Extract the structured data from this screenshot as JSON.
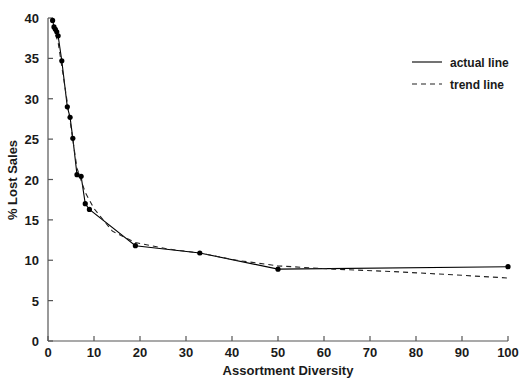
{
  "chart_data": {
    "type": "line",
    "title": "",
    "xlabel": "Assortment Diversity",
    "ylabel": "% Lost Sales",
    "xlim": [
      0,
      100
    ],
    "ylim": [
      0,
      40
    ],
    "xticks": [
      0,
      10,
      20,
      30,
      40,
      50,
      60,
      70,
      80,
      90,
      100
    ],
    "yticks": [
      0,
      5,
      10,
      15,
      20,
      25,
      30,
      35,
      40
    ],
    "xtick_labels": [
      "0",
      "10",
      "20",
      "30",
      "40",
      "50",
      "60",
      "70",
      "80",
      "90",
      "100"
    ],
    "ytick_labels": [
      "0",
      "5",
      "10",
      "15",
      "20",
      "25",
      "30",
      "35",
      "40"
    ],
    "grid": false,
    "legend_position": "top-right",
    "series": [
      {
        "name": "actual line",
        "style": "solid",
        "color": "#000000",
        "markers": true,
        "x": [
          1.0,
          1.3,
          1.6,
          1.9,
          2.2,
          3.0,
          4.2,
          4.8,
          5.4,
          6.3,
          7.2,
          8.1,
          9.0,
          19.0,
          33.0,
          50.0,
          100.0
        ],
        "y": [
          39.7,
          38.9,
          38.6,
          38.3,
          37.8,
          34.7,
          29.0,
          27.7,
          25.1,
          20.6,
          20.4,
          17.0,
          16.3,
          11.8,
          10.9,
          8.9,
          9.2
        ]
      },
      {
        "name": "trend line",
        "style": "dashed",
        "color": "#222222",
        "markers": false,
        "x": [
          1.0,
          2.2,
          3.0,
          4.5,
          6.3,
          8.1,
          10.0,
          14.0,
          19.0,
          26.0,
          33.0,
          41.0,
          50.0,
          62.0,
          75.0,
          88.0,
          100.0
        ],
        "y": [
          39.0,
          37.0,
          34.0,
          28.4,
          21.4,
          18.4,
          16.4,
          13.6,
          12.2,
          11.4,
          10.9,
          10.0,
          9.3,
          8.9,
          8.6,
          8.2,
          7.8
        ]
      }
    ],
    "legend_entries": [
      {
        "label": "actual line",
        "style": "solid"
      },
      {
        "label": "trend line",
        "style": "dashed"
      }
    ]
  }
}
